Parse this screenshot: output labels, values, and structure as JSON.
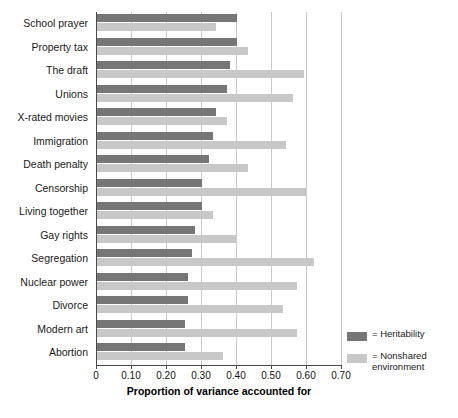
{
  "chart_data": {
    "type": "bar",
    "orientation": "horizontal",
    "title": "",
    "subtitle": "",
    "xlabel": "Proportion of variance accounted for",
    "ylabel": "",
    "xlim": [
      0,
      0.7
    ],
    "xticks": [
      "0",
      "0.10",
      "0.20",
      "0.30",
      "0.40",
      "0.50",
      "0.60",
      "0.70"
    ],
    "xtick_values": [
      0,
      0.1,
      0.2,
      0.3,
      0.4,
      0.5,
      0.6,
      0.7
    ],
    "grid": true,
    "grid_axis": "x",
    "legend_position": "right-bottom",
    "categories": [
      "School prayer",
      "Property tax",
      "The draft",
      "Unions",
      "X-rated movies",
      "Immigration",
      "Death penalty",
      "Censorship",
      "Living together",
      "Gay rights",
      "Segregation",
      "Nuclear power",
      "Divorce",
      "Modern art",
      "Abortion"
    ],
    "series": [
      {
        "name": "Heritability",
        "color": "#767676",
        "values": [
          0.4,
          0.4,
          0.38,
          0.37,
          0.34,
          0.33,
          0.32,
          0.3,
          0.3,
          0.28,
          0.27,
          0.26,
          0.26,
          0.25,
          0.25
        ]
      },
      {
        "name": "Nonshared environment",
        "color": "#c8c8c8",
        "values": [
          0.34,
          0.43,
          0.59,
          0.56,
          0.37,
          0.54,
          0.43,
          0.6,
          0.33,
          0.4,
          0.62,
          0.57,
          0.53,
          0.57,
          0.36
        ]
      }
    ]
  },
  "legend": {
    "items": [
      {
        "label": "= Heritability",
        "color": "#767676"
      },
      {
        "label": "= Nonshared\nenvironment",
        "color": "#c8c8c8"
      }
    ]
  },
  "colors": {
    "heritability": "#767676",
    "nonshared": "#c8c8c8",
    "grid": "#c9c9c9",
    "axis": "#4a4a4a",
    "background": "#ffffff"
  }
}
